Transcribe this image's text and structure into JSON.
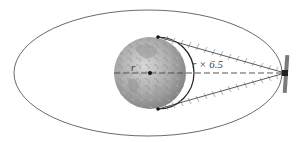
{
  "diagram": {
    "type": "orbit-coverage",
    "labels": {
      "radius": "r",
      "distance": "r × 6.5"
    },
    "elements": {
      "orbit": "elliptical orbit",
      "planet": "Earth",
      "satellite": "satellite",
      "tangent_points": 2,
      "center_point": "Earth center"
    },
    "colors": {
      "line": "#333333",
      "hatch": "#9a9a9a",
      "earth_light": "#c9c9c9",
      "earth_dark": "#7a7a7a",
      "satellite": "#777777"
    }
  }
}
